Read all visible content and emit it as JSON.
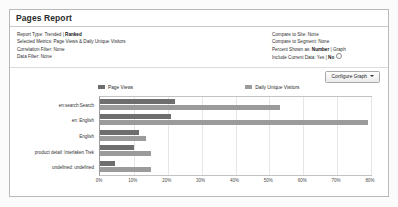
{
  "panel": {
    "title": "Pages Report"
  },
  "info": {
    "left": [
      {
        "label": "Report Type:",
        "value": "Trended | ",
        "bold": "Ranked"
      },
      {
        "label": "Selected Metrics:",
        "value": "Page Views & Daily Unique Visitors",
        "bold": ""
      },
      {
        "label": "Correlation Filter:",
        "value": "None",
        "bold": ""
      },
      {
        "label": "Data Filter:",
        "value": "None",
        "bold": ""
      }
    ],
    "right": [
      {
        "label": "Compare to Site:",
        "value": "None",
        "bold": ""
      },
      {
        "label": "Compare to Segment:",
        "value": "None",
        "bold": ""
      },
      {
        "label": "Percent Shown as:",
        "value": " | Graph",
        "bold": "Number"
      },
      {
        "label": "Include Current Data:",
        "value": "Yes | ",
        "bold": "No",
        "radio": true
      }
    ]
  },
  "toolbar": {
    "configure_graph_label": "Configure Graph"
  },
  "chart_data": {
    "type": "bar",
    "orientation": "horizontal",
    "title": "",
    "xlabel": "",
    "ylabel": "",
    "xlim": [
      0,
      80
    ],
    "grid": true,
    "legend_position": "top",
    "xticks": [
      "0%",
      "10%",
      "20%",
      "30%",
      "40%",
      "50%",
      "60%",
      "70%",
      "80%"
    ],
    "xtick_values": [
      0,
      10,
      20,
      30,
      40,
      50,
      60,
      70,
      80
    ],
    "categories": [
      "en:search:Search",
      "en: English",
      "English",
      "product detail: Interlaken Trek",
      "undefined: undefined"
    ],
    "series": [
      {
        "name": "Page Views",
        "color": "#6e6e6e",
        "values": [
          22,
          21,
          11.5,
          10,
          4.5
        ]
      },
      {
        "name": "Daily Unique Visitors",
        "color": "#9b9b9b",
        "values": [
          53,
          79,
          13.5,
          15,
          15
        ]
      }
    ]
  }
}
